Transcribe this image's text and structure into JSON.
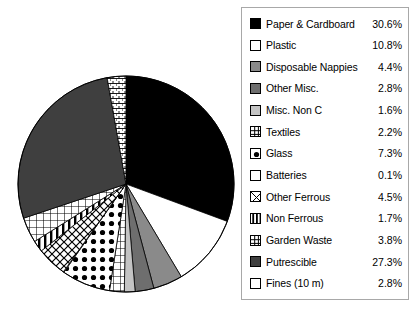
{
  "chart_data": {
    "type": "pie",
    "title": "",
    "legend_position": "right",
    "units": "percent",
    "total": 100.0,
    "categories": [
      "Paper & Cardboard",
      "Plastic",
      "Disposable Nappies",
      "Other Misc.",
      "Misc. Non C",
      "Textiles",
      "Glass",
      "Batteries",
      "Other Ferrous",
      "Non Ferrous",
      "Garden Waste",
      "Putrescible",
      "Fines (10 m)"
    ],
    "values": [
      30.6,
      10.8,
      4.4,
      2.8,
      1.6,
      2.2,
      7.3,
      0.1,
      4.5,
      1.7,
      3.8,
      27.3,
      2.8
    ],
    "labels": [
      "30.6%",
      "10.8%",
      "4.4%",
      "2.8%",
      "1.6%",
      "2.2%",
      "7.3%",
      "0.1%",
      "4.5%",
      "1.7%",
      "3.8%",
      "27.3%",
      "2.8%"
    ],
    "slices": [
      {
        "name": "Paper & Cardboard",
        "value": 30.6,
        "label": "30.6%",
        "pattern": "solid",
        "color": "#000000"
      },
      {
        "name": "Plastic",
        "value": 10.8,
        "label": "10.8%",
        "pattern": "solid",
        "color": "#ffffff"
      },
      {
        "name": "Disposable Nappies",
        "value": 4.4,
        "label": "4.4%",
        "pattern": "solid",
        "color": "#8a8a8a"
      },
      {
        "name": "Other Misc.",
        "value": 2.8,
        "label": "2.8%",
        "pattern": "solid",
        "color": "#6e6e6e"
      },
      {
        "name": "Misc. Non C",
        "value": 1.6,
        "label": "1.6%",
        "pattern": "solid",
        "color": "#c4c4c4"
      },
      {
        "name": "Textiles",
        "value": 2.2,
        "label": "2.2%",
        "pattern": "grid",
        "color": "#ffffff"
      },
      {
        "name": "Glass",
        "value": 7.3,
        "label": "7.3%",
        "pattern": "dots",
        "color": "#ffffff"
      },
      {
        "name": "Batteries",
        "value": 0.1,
        "label": "0.1%",
        "pattern": "solid",
        "color": "#ffffff"
      },
      {
        "name": "Other Ferrous",
        "value": 4.5,
        "label": "4.5%",
        "pattern": "cross",
        "color": "#ffffff"
      },
      {
        "name": "Non Ferrous",
        "value": 1.7,
        "label": "1.7%",
        "pattern": "vstripe",
        "color": "#ffffff"
      },
      {
        "name": "Garden Waste",
        "value": 3.8,
        "label": "3.8%",
        "pattern": "grid",
        "color": "#ffffff"
      },
      {
        "name": "Putrescible",
        "value": 27.3,
        "label": "27.3%",
        "pattern": "solid",
        "color": "#3f3f3f"
      },
      {
        "name": "Fines (10 m)",
        "value": 2.8,
        "label": "2.8%",
        "pattern": "brick",
        "color": "#ffffff"
      }
    ]
  },
  "legend": {
    "items": [
      {
        "label": "Paper & Cardboard",
        "pct": "30.6%",
        "pattern": "solid",
        "color": "#000000"
      },
      {
        "label": "Plastic",
        "pct": "10.8%",
        "pattern": "solid",
        "color": "#ffffff"
      },
      {
        "label": "Disposable Nappies",
        "pct": "4.4%",
        "pattern": "solid",
        "color": "#8a8a8a"
      },
      {
        "label": "Other Misc.",
        "pct": "2.8%",
        "pattern": "solid",
        "color": "#6e6e6e"
      },
      {
        "label": "Misc. Non C",
        "pct": "1.6%",
        "pattern": "solid",
        "color": "#c4c4c4"
      },
      {
        "label": "Textiles",
        "pct": "2.2%",
        "pattern": "grid",
        "color": "#ffffff"
      },
      {
        "label": "Glass",
        "pct": "7.3%",
        "pattern": "dots",
        "color": "#ffffff"
      },
      {
        "label": "Batteries",
        "pct": "0.1%",
        "pattern": "solid",
        "color": "#ffffff"
      },
      {
        "label": "Other Ferrous",
        "pct": "4.5%",
        "pattern": "cross",
        "color": "#ffffff"
      },
      {
        "label": "Non Ferrous",
        "pct": "1.7%",
        "pattern": "vstripe",
        "color": "#ffffff"
      },
      {
        "label": "Garden Waste",
        "pct": "3.8%",
        "pattern": "grid",
        "color": "#ffffff"
      },
      {
        "label": "Putrescible",
        "pct": "27.3%",
        "pattern": "solid",
        "color": "#3f3f3f"
      },
      {
        "label": "Fines (10 m)",
        "pct": "2.8%",
        "pattern": "brick",
        "color": "#ffffff"
      }
    ]
  }
}
